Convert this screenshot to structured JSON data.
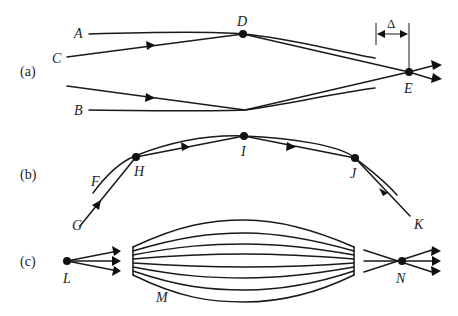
{
  "figure": {
    "panels": [
      {
        "id": "a",
        "label": "(a)",
        "points": {
          "A": "A",
          "B": "B",
          "C": "C",
          "D": "D",
          "E": "E"
        },
        "dimension": "Δ"
      },
      {
        "id": "b",
        "label": "(b)",
        "points": {
          "F": "F",
          "G": "G",
          "H": "H",
          "I": "I",
          "J": "J",
          "K": "K"
        }
      },
      {
        "id": "c",
        "label": "(c)",
        "points": {
          "L": "L",
          "M": "M",
          "N": "N"
        }
      }
    ]
  },
  "colors": {
    "stroke": "#1a1a1a",
    "background": "#ffffff"
  }
}
